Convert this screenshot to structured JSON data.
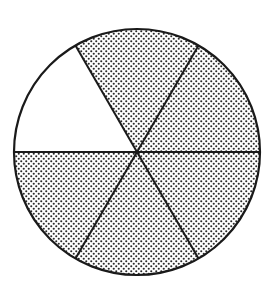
{
  "diagram": {
    "type": "fraction-circle",
    "total_parts": 6,
    "shaded_parts": 5,
    "unshaded_parts": 1,
    "fraction_shaded": "5/6",
    "center": [
      137,
      152
    ],
    "radius": 123,
    "sectors": [
      {
        "index": 0,
        "start_deg": 0,
        "end_deg": 60,
        "shaded": true
      },
      {
        "index": 1,
        "start_deg": 60,
        "end_deg": 120,
        "shaded": true
      },
      {
        "index": 2,
        "start_deg": 120,
        "end_deg": 180,
        "shaded": false
      },
      {
        "index": 3,
        "start_deg": 180,
        "end_deg": 240,
        "shaded": true
      },
      {
        "index": 4,
        "start_deg": 240,
        "end_deg": 300,
        "shaded": true
      },
      {
        "index": 5,
        "start_deg": 300,
        "end_deg": 360,
        "shaded": true
      }
    ],
    "colors": {
      "stroke": "#1a1a1a",
      "dot": "#2a2a2a",
      "background": "#ffffff"
    }
  }
}
